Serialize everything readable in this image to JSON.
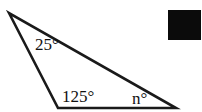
{
  "figure": {
    "type": "geometry-diagram",
    "shape": "triangle",
    "background_color": "#ffffff",
    "stroke_color": "#1a1a1a",
    "text_color": "#111111",
    "width": 202,
    "height": 112,
    "vertices": [
      {
        "name": "apex",
        "x": 9,
        "y": 13
      },
      {
        "name": "base-left",
        "x": 58,
        "y": 108
      },
      {
        "name": "base-right",
        "x": 176,
        "y": 108
      }
    ],
    "angles": [
      {
        "id": "apex",
        "label": "25°",
        "value": 25,
        "unit": "degrees",
        "at_vertex": "apex"
      },
      {
        "id": "base-left",
        "label": "125°",
        "value": 125,
        "unit": "degrees",
        "at_vertex": "base-left"
      },
      {
        "id": "base-right",
        "label": "n°",
        "value": null,
        "unit": "degrees",
        "at_vertex": "base-right"
      }
    ],
    "redaction": {
      "label": "",
      "color": "#0b0b0b",
      "x": 168,
      "y": 10,
      "width": 33,
      "height": 30
    }
  }
}
